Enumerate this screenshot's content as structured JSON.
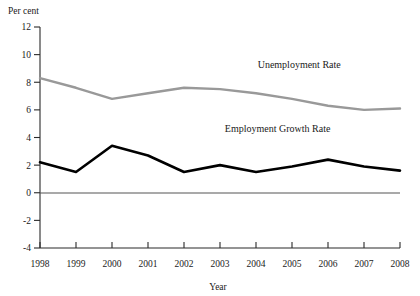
{
  "chart_data": {
    "type": "line",
    "title": "",
    "xlabel": "Year",
    "ylabel": "Per cent",
    "x": [
      1998,
      1999,
      2000,
      2001,
      2002,
      2003,
      2004,
      2005,
      2006,
      2007,
      2008
    ],
    "xtick_labels": [
      "1998",
      "1999",
      "2000",
      "2001",
      "2002",
      "2003",
      "2004",
      "2005",
      "2006",
      "2007",
      "2008"
    ],
    "ytick_labels": [
      "12",
      "10",
      "8",
      "6",
      "4",
      "2",
      "0",
      "-2",
      "-4"
    ],
    "ytick_values": [
      12,
      10,
      8,
      6,
      4,
      2,
      0,
      -2,
      -4
    ],
    "ylim": [
      -4,
      12
    ],
    "xlim": [
      1998,
      2008
    ],
    "grid": false,
    "legend_position": "inline-annotation",
    "series": [
      {
        "name": "Unemployment Rate",
        "color": "#999999",
        "values": [
          8.3,
          7.6,
          6.8,
          7.2,
          7.6,
          7.5,
          7.2,
          6.8,
          6.3,
          6.0,
          6.1
        ]
      },
      {
        "name": "Employment Growth Rate",
        "color": "#000000",
        "values": [
          2.2,
          1.5,
          3.4,
          2.7,
          1.5,
          2.0,
          1.5,
          1.9,
          2.4,
          1.9,
          1.6
        ]
      }
    ],
    "annotations": [
      {
        "text": "Unemployment Rate",
        "x": 2005.2,
        "y": 9.0
      },
      {
        "text": "Employment Growth Rate",
        "x": 2004.6,
        "y": 4.4
      }
    ]
  },
  "axes": {
    "y_axis_title": "Per cent",
    "x_axis_title": "Year"
  }
}
